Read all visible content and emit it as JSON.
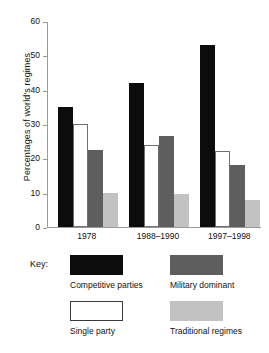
{
  "chart_data": {
    "type": "bar",
    "title": "",
    "xlabel": "",
    "ylabel": "Percentages of world's regimes",
    "ylim": [
      0,
      60
    ],
    "ytick_labels": [
      "60",
      "50",
      "40",
      "30",
      "20",
      "10",
      "0"
    ],
    "ytick_values": [
      60,
      50,
      40,
      30,
      20,
      10,
      0
    ],
    "grid": false,
    "legend_position": "below",
    "categories": [
      "1978",
      "1988–1990",
      "1997–1998"
    ],
    "series": [
      {
        "name": "Competitive parties",
        "color": "#0c0c0c",
        "values": [
          35,
          42,
          53
        ]
      },
      {
        "name": "Single party",
        "color": "#ffffff",
        "values": [
          30,
          24,
          22
        ]
      },
      {
        "name": "Military dominant",
        "color": "#5e5e5e",
        "values": [
          22.5,
          26.5,
          18
        ]
      },
      {
        "name": "Traditional regimes",
        "color": "#c2c2c2",
        "values": [
          10,
          9.5,
          8
        ]
      }
    ]
  },
  "legend": {
    "key_label": "Key:",
    "items": [
      {
        "label": "Competitive parties",
        "swatch": "competitive"
      },
      {
        "label": "Military dominant",
        "swatch": "military"
      },
      {
        "label": "Single party",
        "swatch": "single"
      },
      {
        "label": "Traditional regimes",
        "swatch": "traditional"
      }
    ]
  }
}
